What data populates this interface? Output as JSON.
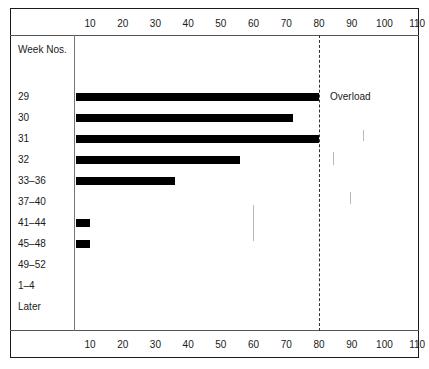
{
  "chart_data": {
    "type": "bar",
    "orientation": "horizontal",
    "title": "",
    "xlabel": "",
    "ylabel": "Week Nos.",
    "xlim": [
      0,
      115
    ],
    "grid": false,
    "legend": null,
    "categories": [
      "29",
      "30",
      "31",
      "32",
      "33–36",
      "37–40",
      "41–44",
      "45–48",
      "49–52",
      "1–4",
      "Later"
    ],
    "values": [
      80,
      72,
      80,
      56,
      36,
      0,
      10,
      10,
      0,
      0,
      0
    ],
    "tick_labels": [
      "10",
      "20",
      "30",
      "40",
      "50",
      "60",
      "70",
      "80",
      "90",
      "100",
      "110"
    ],
    "tick_values": [
      10,
      20,
      30,
      40,
      50,
      60,
      70,
      80,
      90,
      100,
      110
    ],
    "annotations": [
      {
        "text": "Overload",
        "at_value": 80,
        "category": "29"
      }
    ],
    "reference_line": {
      "value": 80,
      "style": "dashed",
      "label": "Overload"
    },
    "colors": {
      "bar": "#000000",
      "axis": "#1a1a1a",
      "reference": "#333333"
    }
  },
  "axis": {
    "category_header": "Week Nos."
  }
}
